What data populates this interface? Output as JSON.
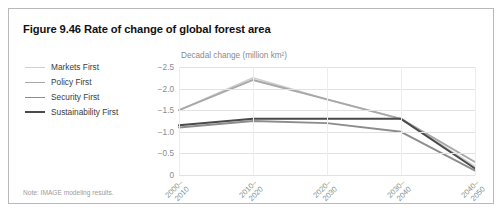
{
  "figure": {
    "title": "Figure 9.46 Rate of change of global forest area",
    "footnote": "Note: IMAGE modeling results."
  },
  "legend": {
    "items": [
      {
        "label": "Markets First",
        "color": "#d0d0d0",
        "width": 1.7
      },
      {
        "label": "Policy First",
        "color": "#a8a8a8",
        "width": 1.9
      },
      {
        "label": "Security First",
        "color": "#8c8c8c",
        "width": 1.9
      },
      {
        "label": "Sustainability First",
        "color": "#4a4a4a",
        "width": 2.0
      }
    ]
  },
  "chart_data": {
    "type": "line",
    "title": "Figure 9.46 Rate of change of global forest area",
    "xlabel": "",
    "ylabel": "Decadal change (million km²)",
    "categories": [
      "2000–\n2010",
      "2010–\n2020",
      "2020–\n2030",
      "2030–\n2040",
      "2040–\n2050"
    ],
    "category_labels": [
      [
        "2000–",
        "2010"
      ],
      [
        "2010–",
        "2020"
      ],
      [
        "2020–",
        "2030"
      ],
      [
        "2030–",
        "2040"
      ],
      [
        "2040–",
        "2050"
      ]
    ],
    "ylim": [
      -2.5,
      0
    ],
    "yticks": [
      -2.5,
      -2.0,
      -1.5,
      -1.0,
      -0.5,
      0
    ],
    "ytick_labels": [
      "−2.5",
      "−2.0",
      "−1.5",
      "−1.0",
      "−0.5",
      "0"
    ],
    "y_axis_inverted": true,
    "grid": true,
    "legend_position": "left",
    "series": [
      {
        "name": "Markets First",
        "color": "#d0d0d0",
        "width": 1.7,
        "values": [
          -1.5,
          -2.25,
          -1.75,
          -1.3,
          -0.2
        ]
      },
      {
        "name": "Policy First",
        "color": "#a8a8a8",
        "width": 1.9,
        "values": [
          -1.5,
          -2.2,
          -1.75,
          -1.3,
          -0.3
        ]
      },
      {
        "name": "Security First",
        "color": "#8c8c8c",
        "width": 1.9,
        "values": [
          -1.1,
          -1.25,
          -1.2,
          -1.0,
          -0.1
        ]
      },
      {
        "name": "Sustainability First",
        "color": "#4a4a4a",
        "width": 2.0,
        "values": [
          -1.15,
          -1.3,
          -1.3,
          -1.3,
          -0.15
        ]
      }
    ]
  }
}
